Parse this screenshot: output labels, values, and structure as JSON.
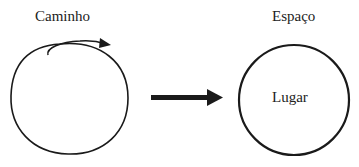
{
  "diagram": {
    "left": {
      "title": "Caminho",
      "shape": "hand-drawn-circle",
      "annotation": "curved-arrow-icon"
    },
    "connector": {
      "type": "arrow",
      "direction": "right"
    },
    "right": {
      "title": "Espaço",
      "shape": "circle",
      "inner_label": "Lugar"
    }
  },
  "colors": {
    "stroke": "#1a1a1a",
    "text": "#222222",
    "background": "#ffffff"
  }
}
